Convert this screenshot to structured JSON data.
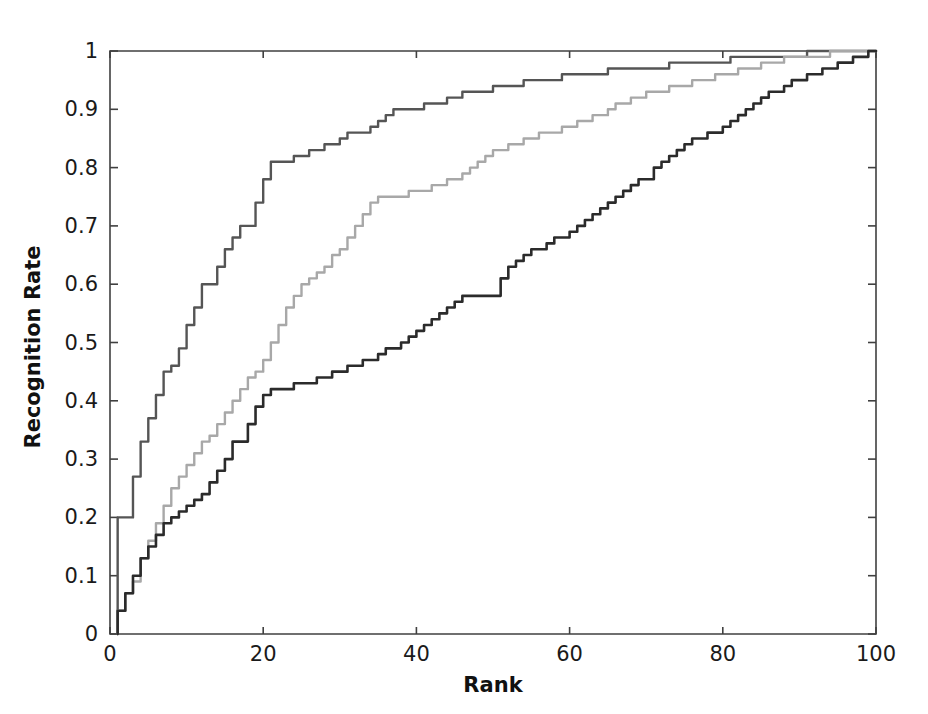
{
  "figure": {
    "background_color": "#ffffff",
    "axes_color": "#404040"
  },
  "axis": {
    "x_label": "Rank",
    "y_label": "Recognition Rate",
    "x_ticks": [
      "0",
      "20",
      "40",
      "60",
      "80",
      "100"
    ],
    "y_ticks": [
      "0",
      "0.1",
      "0.2",
      "0.3",
      "0.4",
      "0.5",
      "0.6",
      "0.7",
      "0.8",
      "0.9",
      "1"
    ]
  },
  "chart_data": {
    "type": "line",
    "title": "",
    "subtitle": "",
    "xlabel": "Rank",
    "ylabel": "Recognition Rate",
    "xlim": [
      0,
      100
    ],
    "ylim": [
      0,
      1
    ],
    "xticks": [
      0,
      20,
      40,
      60,
      80,
      100
    ],
    "yticks": [
      0,
      0.1,
      0.2,
      0.3,
      0.4,
      0.5,
      0.6,
      0.7,
      0.8,
      0.9,
      1.0
    ],
    "grid": false,
    "legend": null,
    "legend_position": "none",
    "annotations": [],
    "x": [
      1,
      2,
      3,
      4,
      5,
      6,
      7,
      8,
      9,
      10,
      11,
      12,
      13,
      14,
      15,
      16,
      17,
      18,
      19,
      20,
      21,
      22,
      23,
      24,
      25,
      26,
      27,
      28,
      29,
      30,
      31,
      32,
      33,
      34,
      35,
      36,
      37,
      38,
      39,
      40,
      41,
      42,
      43,
      44,
      45,
      46,
      47,
      48,
      49,
      50,
      51,
      52,
      53,
      54,
      55,
      56,
      57,
      58,
      59,
      60,
      61,
      62,
      63,
      64,
      65,
      66,
      67,
      68,
      69,
      70,
      71,
      72,
      73,
      74,
      75,
      76,
      77,
      78,
      79,
      80,
      81,
      82,
      83,
      84,
      85,
      86,
      87,
      88,
      89,
      90,
      91,
      92,
      93,
      94,
      95,
      96,
      97,
      98,
      99,
      100
    ],
    "series": [
      {
        "name": "curve-upper",
        "color": "#555555",
        "linewidth": 2.4,
        "values": [
          0.2,
          0.2,
          0.27,
          0.33,
          0.37,
          0.41,
          0.45,
          0.46,
          0.49,
          0.53,
          0.56,
          0.6,
          0.6,
          0.63,
          0.66,
          0.68,
          0.7,
          0.7,
          0.74,
          0.78,
          0.81,
          0.81,
          0.81,
          0.82,
          0.82,
          0.83,
          0.83,
          0.84,
          0.84,
          0.85,
          0.86,
          0.86,
          0.86,
          0.87,
          0.88,
          0.89,
          0.9,
          0.9,
          0.9,
          0.9,
          0.91,
          0.91,
          0.91,
          0.92,
          0.92,
          0.93,
          0.93,
          0.93,
          0.93,
          0.94,
          0.94,
          0.94,
          0.94,
          0.95,
          0.95,
          0.95,
          0.95,
          0.95,
          0.96,
          0.96,
          0.96,
          0.96,
          0.96,
          0.96,
          0.97,
          0.97,
          0.97,
          0.97,
          0.97,
          0.97,
          0.97,
          0.97,
          0.98,
          0.98,
          0.98,
          0.98,
          0.98,
          0.98,
          0.98,
          0.98,
          0.99,
          0.99,
          0.99,
          0.99,
          0.99,
          0.99,
          0.99,
          0.99,
          0.99,
          0.99,
          1.0,
          1.0,
          1.0,
          1.0,
          1.0,
          1.0,
          1.0,
          1.0,
          1.0,
          1.0
        ]
      },
      {
        "name": "curve-middle",
        "color": "#a8a8a8",
        "linewidth": 2.4,
        "values": [
          0.04,
          0.07,
          0.09,
          0.13,
          0.16,
          0.19,
          0.22,
          0.25,
          0.27,
          0.29,
          0.31,
          0.33,
          0.34,
          0.36,
          0.38,
          0.4,
          0.42,
          0.44,
          0.45,
          0.47,
          0.5,
          0.53,
          0.56,
          0.58,
          0.6,
          0.61,
          0.62,
          0.63,
          0.65,
          0.66,
          0.68,
          0.7,
          0.72,
          0.74,
          0.75,
          0.75,
          0.75,
          0.75,
          0.76,
          0.76,
          0.76,
          0.77,
          0.77,
          0.78,
          0.78,
          0.79,
          0.8,
          0.81,
          0.82,
          0.83,
          0.83,
          0.84,
          0.84,
          0.85,
          0.85,
          0.86,
          0.86,
          0.86,
          0.87,
          0.87,
          0.88,
          0.88,
          0.89,
          0.89,
          0.9,
          0.91,
          0.91,
          0.92,
          0.92,
          0.93,
          0.93,
          0.93,
          0.94,
          0.94,
          0.94,
          0.95,
          0.95,
          0.95,
          0.96,
          0.96,
          0.96,
          0.97,
          0.97,
          0.97,
          0.98,
          0.98,
          0.98,
          0.99,
          0.99,
          0.99,
          0.99,
          0.99,
          0.99,
          1.0,
          1.0,
          1.0,
          1.0,
          1.0,
          1.0,
          1.0
        ]
      },
      {
        "name": "curve-lower",
        "color": "#2b2b2b",
        "linewidth": 2.6,
        "values": [
          0.04,
          0.07,
          0.1,
          0.13,
          0.15,
          0.17,
          0.19,
          0.2,
          0.21,
          0.22,
          0.23,
          0.24,
          0.26,
          0.28,
          0.3,
          0.33,
          0.33,
          0.36,
          0.39,
          0.41,
          0.42,
          0.42,
          0.42,
          0.43,
          0.43,
          0.43,
          0.44,
          0.44,
          0.45,
          0.45,
          0.46,
          0.46,
          0.47,
          0.47,
          0.48,
          0.49,
          0.49,
          0.5,
          0.51,
          0.52,
          0.53,
          0.54,
          0.55,
          0.56,
          0.57,
          0.58,
          0.58,
          0.58,
          0.58,
          0.58,
          0.61,
          0.63,
          0.64,
          0.65,
          0.66,
          0.66,
          0.67,
          0.68,
          0.68,
          0.69,
          0.7,
          0.71,
          0.72,
          0.73,
          0.74,
          0.75,
          0.76,
          0.77,
          0.78,
          0.78,
          0.8,
          0.81,
          0.82,
          0.83,
          0.84,
          0.85,
          0.85,
          0.86,
          0.86,
          0.87,
          0.88,
          0.89,
          0.9,
          0.91,
          0.92,
          0.93,
          0.93,
          0.94,
          0.95,
          0.95,
          0.96,
          0.96,
          0.97,
          0.97,
          0.98,
          0.98,
          0.99,
          0.99,
          1.0,
          1.0
        ]
      }
    ]
  }
}
